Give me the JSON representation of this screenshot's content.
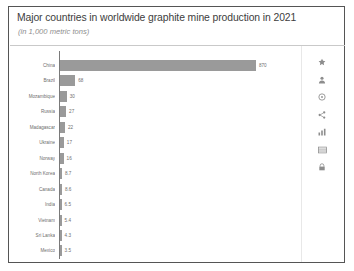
{
  "card": {
    "title": "Major countries in worldwide graphite mine production in 2021",
    "subtitle": "(in 1,000 metric tons)"
  },
  "chart_data": {
    "type": "bar",
    "orientation": "horizontal",
    "title": "Major countries in worldwide graphite mine production in 2021",
    "subtitle": "(in 1,000 metric tons)",
    "xlabel": "",
    "ylabel": "",
    "grid": false,
    "legend": null,
    "bar_color": "#9a9a9a",
    "xlim": [
      0,
      870
    ],
    "categories": [
      "China",
      "Brazil",
      "Mozambique",
      "Russia",
      "Madagascar",
      "Ukraine",
      "Norway",
      "North Korea",
      "Canada",
      "India",
      "Vietnam",
      "Sri Lanka",
      "Mexico"
    ],
    "values": [
      870,
      68,
      30,
      27,
      22,
      17,
      16,
      8.7,
      8.6,
      6.5,
      5.4,
      4.3,
      3.5
    ],
    "value_labels": [
      "870",
      "68",
      "30",
      "27",
      "22",
      "17",
      "16",
      "8.7",
      "8.6",
      "6.5",
      "5.4",
      "4.3",
      "3.5"
    ]
  },
  "icon_rail": [
    {
      "name": "star-icon"
    },
    {
      "name": "person-icon"
    },
    {
      "name": "info-circle-icon"
    },
    {
      "name": "share-icon"
    },
    {
      "name": "statistics-icon"
    },
    {
      "name": "table-icon"
    },
    {
      "name": "lock-icon"
    }
  ]
}
